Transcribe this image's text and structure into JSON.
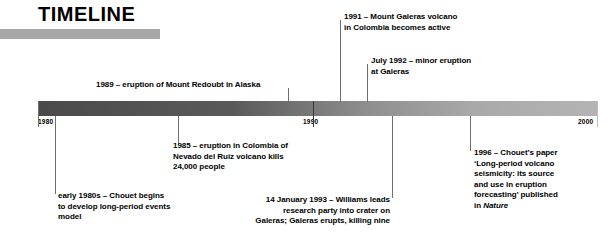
{
  "title": "TIMELINE",
  "axis": {
    "ticks": [
      {
        "label": "1980"
      },
      {
        "label": "1990"
      },
      {
        "label": "2000"
      }
    ],
    "start_year": 1980,
    "end_year": 2000,
    "bar_color_start": "#4a4a4a",
    "bar_color_end": "#b4b4b4",
    "rule_color": "#a8a8a8"
  },
  "events": [
    {
      "id": "early-1980s",
      "line1": "early 1980s – Chouet begins",
      "line2": "to develop long-period events",
      "line3": "model"
    },
    {
      "id": "1985",
      "line1": "1985 – eruption in Colombia of",
      "line2": "Nevado del Ruiz volcano kills",
      "line3": "24,000 people"
    },
    {
      "id": "1989",
      "line1": "1989 – eruption of Mount Redoubt in Alaska"
    },
    {
      "id": "1991",
      "line1": "1991 – Mount Galeras volcano",
      "line2": "in Colombia becomes active"
    },
    {
      "id": "july-1992",
      "line1": "July 1992 – minor eruption",
      "line2": "at Galeras"
    },
    {
      "id": "1993",
      "line1": "14 January 1993 – Williams leads",
      "line2": "research party into crater on",
      "line3": "Galeras; Galeras erupts, killing nine"
    },
    {
      "id": "1996",
      "line1": "1996 – Chouet’s paper",
      "line2": "‘Long-period volcano",
      "line3": "seismicity: its source",
      "line4": "and use in eruption",
      "line5": "forecasting’ published",
      "line6_prefix": "in ",
      "line6_italic": "Nature"
    }
  ]
}
